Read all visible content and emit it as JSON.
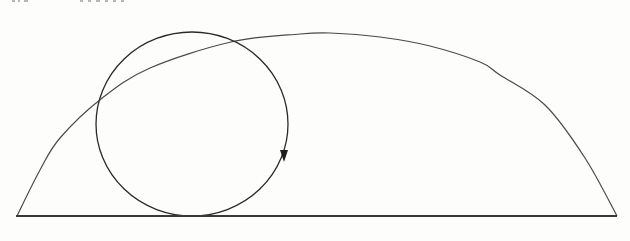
{
  "figure": {
    "colors": {
      "background": "#fdfdfb",
      "circle_stroke": "#2a2a2a",
      "curve_stroke": "#4a4a4a",
      "baseline_stroke": "#3a3a3a"
    },
    "baseline": {
      "x1": 16,
      "y1": 216,
      "x2": 617,
      "y2": 216
    },
    "rolling_circle": {
      "cx": 192,
      "cy": 124,
      "rx": 96,
      "ry": 92
    },
    "direction_arrow": {
      "x": 284,
      "y": 158,
      "direction": "clockwise-down"
    },
    "traced_curve": {
      "points": [
        [
          17,
          216
        ],
        [
          40,
          170
        ],
        [
          60,
          138
        ],
        [
          101,
          99
        ],
        [
          150,
          68
        ],
        [
          231,
          42
        ],
        [
          300,
          34
        ],
        [
          330,
          33
        ],
        [
          380,
          37
        ],
        [
          430,
          46
        ],
        [
          480,
          62
        ],
        [
          500,
          75
        ],
        [
          545,
          105
        ],
        [
          585,
          158
        ],
        [
          617,
          216
        ]
      ]
    }
  },
  "header": {
    "clipped_text_left": "",
    "clipped_text_right": ""
  }
}
